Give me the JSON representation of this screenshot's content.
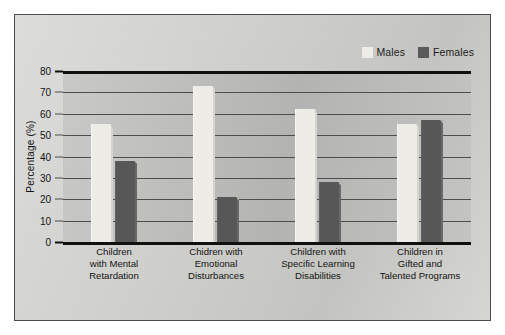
{
  "chart_data": {
    "type": "bar",
    "title": "",
    "xlabel": "",
    "ylabel": "Percentage (%)",
    "ylim": [
      0,
      80
    ],
    "ytick_step": 10,
    "yticks": [
      "80",
      "70",
      "60",
      "50",
      "40",
      "30",
      "20",
      "10",
      "0"
    ],
    "grid": true,
    "legend_position": "top-right",
    "categories": [
      "Children with Mental Retardation",
      "Chidren with Emotional Disturbances",
      "Children with Specific Learning Disabilities",
      "Children in Gifted and Talented Programs"
    ],
    "category_lines": [
      [
        "Children",
        "with Mental",
        "Retardation"
      ],
      [
        "Chidren with",
        "Emotional",
        "Disturbances"
      ],
      [
        "Children with",
        "Specific Learning",
        "Disabilities"
      ],
      [
        "Children in",
        "Gifted and",
        "Talented Programs"
      ]
    ],
    "series": [
      {
        "name": "Males",
        "color": "#eeece6",
        "values": [
          55,
          73,
          62,
          55
        ]
      },
      {
        "name": "Females",
        "color": "#575757",
        "values": [
          38,
          21,
          28,
          57
        ]
      }
    ]
  },
  "legend": {
    "entries": [
      {
        "label": "Males",
        "swatch": "males-swatch"
      },
      {
        "label": "Females",
        "swatch": "females-swatch"
      }
    ]
  },
  "colors": {
    "page_background": "#ffffff",
    "figure_background": "#cfcfcc",
    "plot_background": "#bdbdbb",
    "axis": "#101010",
    "gridline": "#4d4d4d",
    "text": "#141414",
    "males_bar": "#eeece6",
    "females_bar": "#575757"
  }
}
